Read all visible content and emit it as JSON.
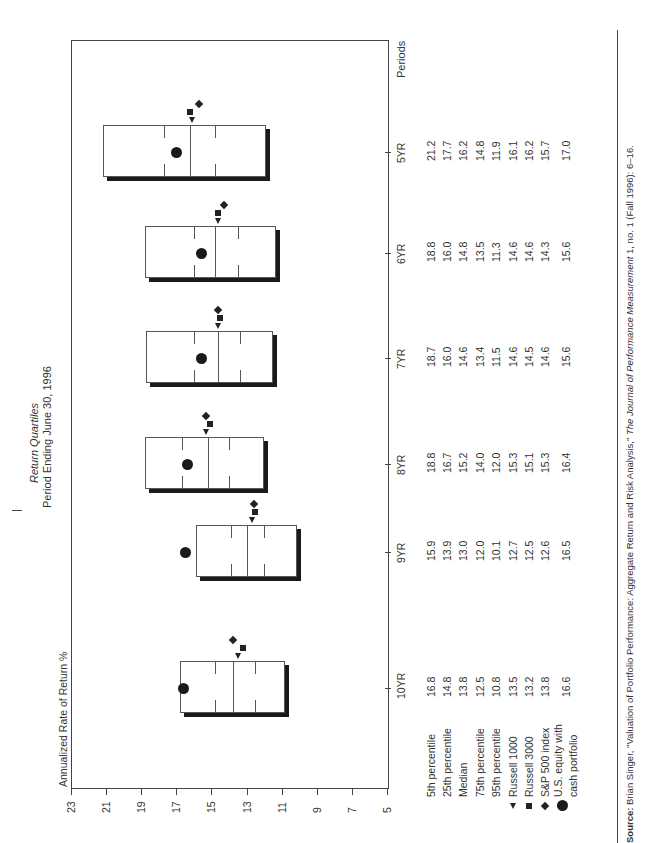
{
  "chart_data": {
    "type": "box",
    "title": "Return Quartiles",
    "subtitle": "Period Ending June 30, 1996",
    "ylabel": "Annualized Rate of Return %",
    "xlabel": "Periods",
    "ylim": [
      5,
      23
    ],
    "yticks": [
      23,
      21,
      19,
      17,
      15,
      13,
      11,
      9,
      7,
      5
    ],
    "categories": [
      "10YR",
      "9YR",
      "8YR",
      "7YR",
      "6YR",
      "5YR"
    ],
    "series": [
      {
        "name": "5th percentile",
        "values": [
          16.8,
          15.9,
          18.8,
          18.7,
          18.8,
          21.2
        ]
      },
      {
        "name": "25th percentile",
        "values": [
          14.8,
          13.9,
          16.7,
          16.0,
          16.0,
          17.7
        ]
      },
      {
        "name": "Median",
        "values": [
          13.8,
          13.0,
          15.2,
          14.6,
          14.8,
          16.2
        ]
      },
      {
        "name": "75th percentile",
        "values": [
          12.5,
          12.0,
          14.0,
          13.4,
          13.5,
          14.8
        ]
      },
      {
        "name": "95th percentile",
        "values": [
          10.8,
          10.1,
          12.0,
          11.5,
          11.3,
          11.9
        ]
      },
      {
        "name": "Russell 1000",
        "marker": "triangle",
        "values": [
          13.5,
          12.7,
          15.3,
          14.6,
          14.6,
          16.1
        ]
      },
      {
        "name": "Russell 3000",
        "marker": "square",
        "values": [
          13.2,
          12.5,
          15.1,
          14.5,
          14.6,
          16.2
        ]
      },
      {
        "name": "S&P 500 index",
        "marker": "diamond",
        "values": [
          13.8,
          12.6,
          15.3,
          14.6,
          14.3,
          15.7
        ]
      },
      {
        "name": "U.S. equity with cash portfolio",
        "marker": "circle",
        "values": [
          16.6,
          16.5,
          16.4,
          15.6,
          15.6,
          17.0
        ]
      }
    ],
    "grid": false,
    "legend_position": "table-below"
  },
  "table": {
    "rows": [
      {
        "label": "5th percentile",
        "marker": "",
        "values": [
          "16.8",
          "15.9",
          "18.8",
          "18.7",
          "18.8",
          "21.2"
        ]
      },
      {
        "label": "25th percentile",
        "marker": "",
        "values": [
          "14.8",
          "13.9",
          "16.7",
          "16.0",
          "16.0",
          "17.7"
        ]
      },
      {
        "label": "Median",
        "marker": "",
        "values": [
          "13.8",
          "13.0",
          "15.2",
          "14.6",
          "14.8",
          "16.2"
        ]
      },
      {
        "label": "75th percentile",
        "marker": "",
        "values": [
          "12.5",
          "12.0",
          "14.0",
          "13.4",
          "13.5",
          "14.8"
        ]
      },
      {
        "label": "95th percentile",
        "marker": "",
        "values": [
          "10.8",
          "10.1",
          "12.0",
          "11.5",
          "11.3",
          "11.9"
        ]
      },
      {
        "label": "Russell 1000",
        "marker": "triangle",
        "values": [
          "13.5",
          "12.7",
          "15.3",
          "14.6",
          "14.6",
          "16.1"
        ]
      },
      {
        "label": "Russell 3000",
        "marker": "square",
        "values": [
          "13.2",
          "12.5",
          "15.1",
          "14.5",
          "14.6",
          "16.2"
        ]
      },
      {
        "label": "S&P 500 index",
        "marker": "diamond",
        "values": [
          "13.8",
          "12.6",
          "15.3",
          "14.6",
          "14.3",
          "15.7"
        ]
      },
      {
        "label": "U.S. equity with",
        "label2": "cash portfolio",
        "marker": "circle",
        "values": [
          "16.6",
          "16.5",
          "16.4",
          "15.6",
          "15.6",
          "17.0"
        ]
      }
    ]
  },
  "source": {
    "prefix": "Source:",
    "text": " Brian Singer, \"Valuation of Portfolio Performance: Aggregate Return and Risk Analysis,\" ",
    "journal": "The Journal of Performance Measurement",
    "suffix": " 1, no. 1 (Fall 1996): 6–16."
  },
  "colors": {
    "ink": "#1a1a1a",
    "box_border": "#555555",
    "background": "#ffffff"
  }
}
